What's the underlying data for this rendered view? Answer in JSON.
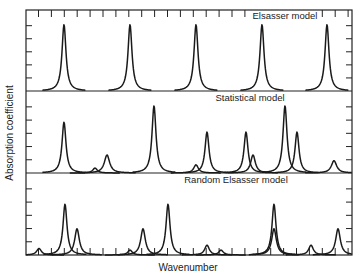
{
  "figure": {
    "ylabel": "Absorption coefficient",
    "xlabel": "Wavenumber",
    "panels": [
      {
        "title": "Elsasser model"
      },
      {
        "title": "Statistical model"
      },
      {
        "title": "Random Elsasser model"
      }
    ]
  },
  "chart_data": {
    "type": "line",
    "xlabel": "Wavenumber",
    "ylabel": "Absorption coefficient",
    "grid": false,
    "panels": [
      {
        "name": "Elsasser model",
        "description": "Equally spaced Lorentz lines of equal strength",
        "lines": [
          {
            "x": 64,
            "height": 0.82,
            "width": 2.4
          },
          {
            "x": 130,
            "height": 0.82,
            "width": 2.4
          },
          {
            "x": 196,
            "height": 0.82,
            "width": 2.4
          },
          {
            "x": 262,
            "height": 0.82,
            "width": 2.4
          },
          {
            "x": 327,
            "height": 0.82,
            "width": 2.4
          }
        ]
      },
      {
        "name": "Statistical model",
        "description": "Randomly placed Lorentz lines with random strengths",
        "lines": [
          {
            "x": 64,
            "height": 0.62,
            "width": 2.4
          },
          {
            "x": 95,
            "height": 0.06,
            "width": 2.8
          },
          {
            "x": 107,
            "height": 0.22,
            "width": 3.2
          },
          {
            "x": 154,
            "height": 0.82,
            "width": 2.4
          },
          {
            "x": 196,
            "height": 0.1,
            "width": 2.8
          },
          {
            "x": 207,
            "height": 0.5,
            "width": 2.4
          },
          {
            "x": 246,
            "height": 0.5,
            "width": 2.4
          },
          {
            "x": 253,
            "height": 0.22,
            "width": 2.8
          },
          {
            "x": 285,
            "height": 0.82,
            "width": 2.4
          },
          {
            "x": 297,
            "height": 0.5,
            "width": 2.4
          },
          {
            "x": 334,
            "height": 0.15,
            "width": 3.2
          }
        ]
      },
      {
        "name": "Random Elsasser model",
        "description": "Superposition of several Elsasser bands with random offsets",
        "lines": [
          {
            "x": 39,
            "height": 0.08,
            "width": 2.8
          },
          {
            "x": 65,
            "height": 0.62,
            "width": 2.4
          },
          {
            "x": 77,
            "height": 0.32,
            "width": 2.8
          },
          {
            "x": 130,
            "height": 0.06,
            "width": 2.8
          },
          {
            "x": 143,
            "height": 0.32,
            "width": 2.8
          },
          {
            "x": 168,
            "height": 0.62,
            "width": 2.4
          },
          {
            "x": 207,
            "height": 0.12,
            "width": 2.8
          },
          {
            "x": 221,
            "height": 0.06,
            "width": 2.8
          },
          {
            "x": 274,
            "height": 0.62,
            "width": 2.4
          },
          {
            "x": 274,
            "height": 0.32,
            "width": 2.8
          },
          {
            "x": 311,
            "height": 0.12,
            "width": 2.8
          },
          {
            "x": 338,
            "height": 0.32,
            "width": 2.8
          }
        ]
      }
    ],
    "xlim": [
      26,
      352
    ]
  }
}
